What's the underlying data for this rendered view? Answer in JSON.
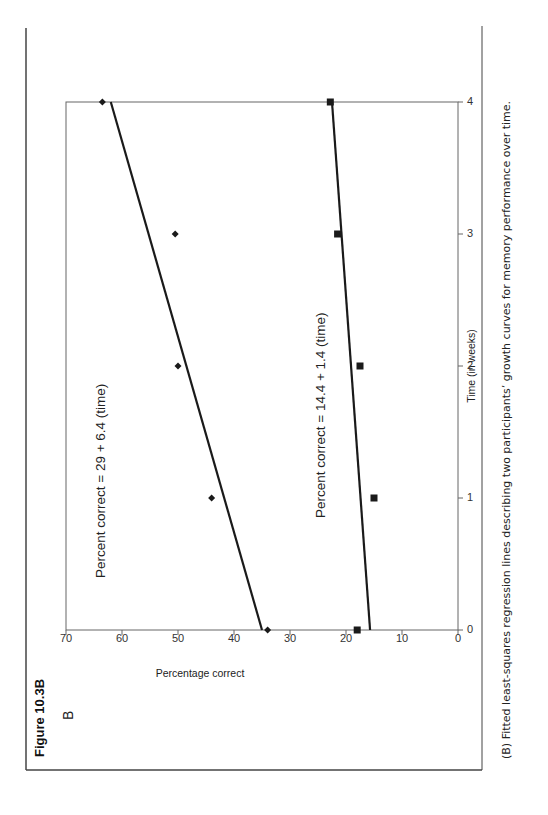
{
  "figure": {
    "title": "Figure 10.3B",
    "panel_label": "B",
    "caption": "(B) Fitted least-squares regression lines describing two participants’ growth curves for memory performance over time."
  },
  "chart_data": {
    "type": "scatter",
    "title": "",
    "xlabel": "Time (in weeks)",
    "ylabel": "Percentage correct",
    "xlim": [
      0,
      4
    ],
    "ylim": [
      0,
      70
    ],
    "x_ticks": [
      "0",
      "1",
      "2",
      "3",
      "4"
    ],
    "y_ticks": [
      "0",
      "10",
      "20",
      "30",
      "40",
      "50",
      "60",
      "70"
    ],
    "grid": false,
    "legend": null,
    "x": [
      0,
      1,
      2,
      3,
      4
    ],
    "series": [
      {
        "name": "Participant 1",
        "marker": "diamond",
        "values": [
          34,
          44,
          50,
          50.5,
          63.5
        ],
        "fit_line": {
          "start": [
            0,
            35
          ],
          "end": [
            4,
            62
          ]
        },
        "equation": "Percent  correct = 29 + 6.4 (time)"
      },
      {
        "name": "Participant 2",
        "marker": "square",
        "values": [
          18,
          15,
          17.5,
          21.5,
          22.8
        ],
        "fit_line": {
          "start": [
            0,
            15.7
          ],
          "end": [
            4,
            22.5
          ]
        },
        "equation": "Percent  correct = 14.4 + 1.4 (time)"
      }
    ],
    "annotations": [
      "Percent  correct = 29 + 6.4 (time)",
      "Percent  correct = 14.4 + 1.4 (time)"
    ]
  },
  "colors": {
    "ink": "#1a1a1a",
    "axis": "#666666",
    "frame": "#444444"
  }
}
